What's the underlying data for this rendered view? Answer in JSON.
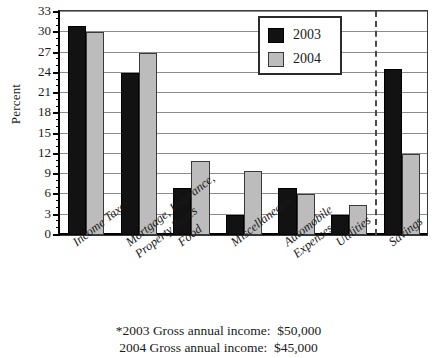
{
  "chart_data": {
    "type": "bar",
    "title": "",
    "xlabel": "",
    "ylabel": "Percent",
    "ylim": [
      0,
      33
    ],
    "ytick_step": 3,
    "yticks": [
      0,
      3,
      6,
      9,
      12,
      15,
      18,
      21,
      24,
      27,
      30,
      33
    ],
    "grid": true,
    "legend_position": "top-center-right",
    "categories": [
      "Income Taxes",
      "Mortgage, Insurance, Property Taxes",
      "Food",
      "Miscellaneous",
      "Automobile Expenses",
      "Utilities",
      "Savings"
    ],
    "category_lines": [
      [
        "Income Taxes"
      ],
      [
        "Mortgage, Insurance,",
        "Property Taxes"
      ],
      [
        "Food"
      ],
      [
        "Miscellaneous"
      ],
      [
        "Automobile",
        "Expenses"
      ],
      [
        "Utilities"
      ],
      [
        "Savings"
      ]
    ],
    "series": [
      {
        "name": "2003",
        "color": "#121212",
        "values": [
          31,
          24,
          7,
          3,
          7,
          3,
          24.5
        ]
      },
      {
        "name": "2004",
        "color": "#bcbcbc",
        "values": [
          30,
          27,
          11,
          9.5,
          6,
          4.5,
          12
        ]
      }
    ],
    "annotations": {
      "separator_after_category": "Utilities",
      "separator_style": "dashed vertical line"
    }
  },
  "axis": {
    "y_title": "Percent",
    "y_tick_labels": [
      "0",
      "3",
      "6",
      "9",
      "12",
      "15",
      "18",
      "21",
      "24",
      "27",
      "30",
      "33"
    ]
  },
  "legend": {
    "items": [
      {
        "label": "2003",
        "swatch": "black-square"
      },
      {
        "label": "2004",
        "swatch": "gray-square"
      }
    ]
  },
  "footnote": {
    "line1": "*2003 Gross annual income:  $50,000",
    "line2": "2004 Gross annual income:  $45,000"
  }
}
